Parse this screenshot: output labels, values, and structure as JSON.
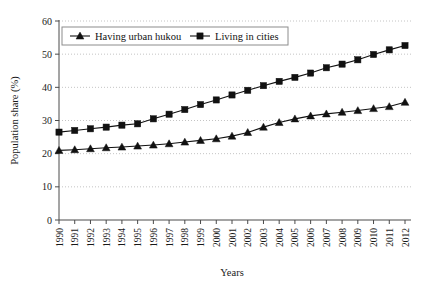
{
  "chart_data": {
    "type": "line",
    "title": "",
    "xlabel": "Years",
    "ylabel": "Population share (%)",
    "xlim": [
      1990,
      2012
    ],
    "ylim": [
      0,
      60
    ],
    "yticks": [
      0,
      10,
      20,
      30,
      40,
      50,
      60
    ],
    "grid": true,
    "legend_position": "top-left-inside",
    "categories": [
      "1990",
      "1991",
      "1992",
      "1993",
      "1994",
      "1995",
      "1996",
      "1997",
      "1998",
      "1999",
      "2000",
      "2001",
      "2002",
      "2003",
      "2004",
      "2005",
      "2006",
      "2007",
      "2008",
      "2009",
      "2010",
      "2011",
      "2012"
    ],
    "x": [
      1990,
      1991,
      1992,
      1993,
      1994,
      1995,
      1996,
      1997,
      1998,
      1999,
      2000,
      2001,
      2002,
      2003,
      2004,
      2005,
      2006,
      2007,
      2008,
      2009,
      2010,
      2011,
      2012
    ],
    "series": [
      {
        "name": "Having urban hukou",
        "marker": "triangle",
        "values": [
          21.0,
          21.2,
          21.5,
          21.8,
          22.0,
          22.3,
          22.6,
          23.0,
          23.5,
          24.0,
          24.5,
          25.3,
          26.4,
          28.0,
          29.4,
          30.5,
          31.4,
          32.0,
          32.5,
          33.0,
          33.6,
          34.2,
          35.5
        ]
      },
      {
        "name": "Living in cities",
        "marker": "square",
        "values": [
          26.5,
          27.0,
          27.5,
          28.0,
          28.6,
          29.0,
          30.5,
          31.9,
          33.3,
          34.8,
          36.2,
          37.7,
          39.1,
          40.5,
          41.8,
          43.0,
          44.3,
          45.9,
          47.0,
          48.3,
          49.9,
          51.3,
          52.6
        ]
      }
    ]
  }
}
